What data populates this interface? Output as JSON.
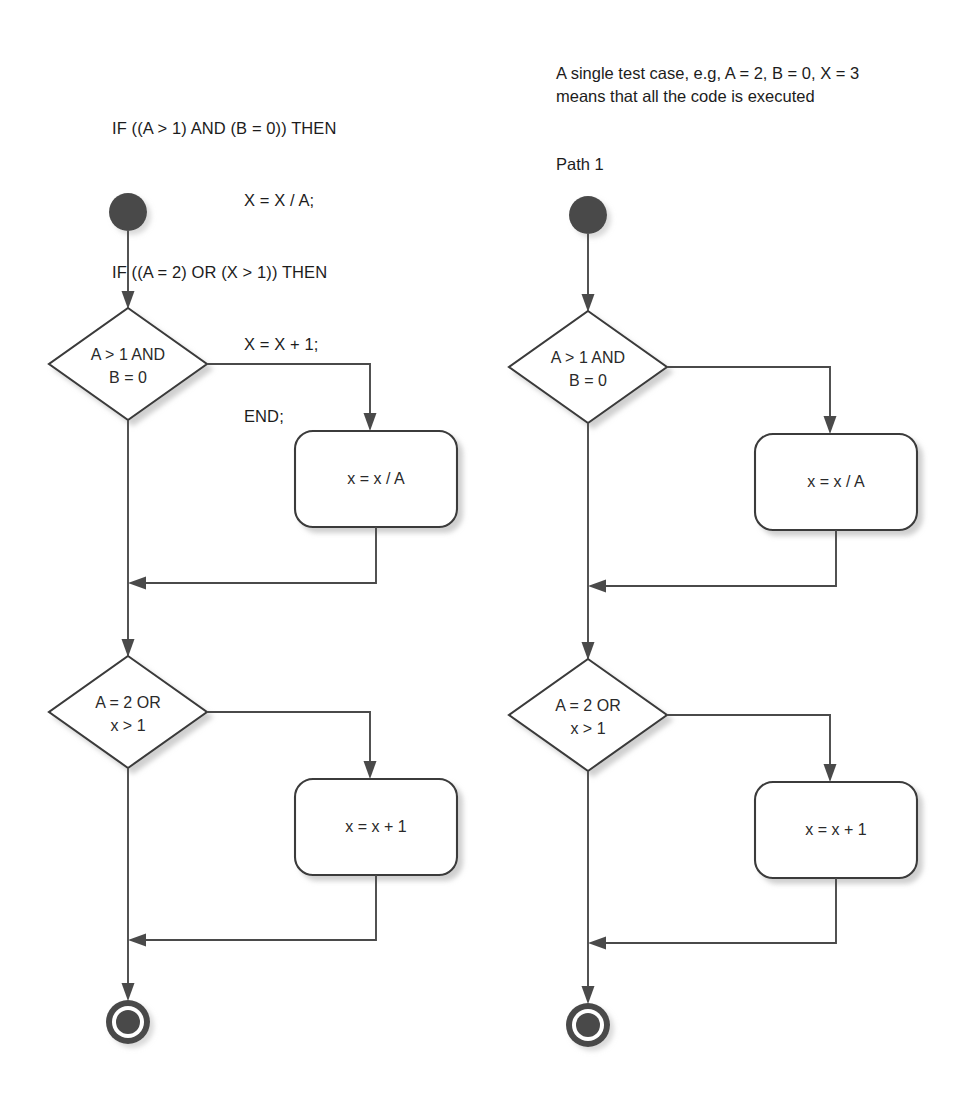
{
  "page": {
    "background": "#ffffff",
    "width": 971,
    "height": 1107
  },
  "colors": {
    "stroke": "#3a3a3a",
    "connector": "#4a4a4a",
    "node_fill": "#ffffff",
    "text": "#1c1c1c",
    "shadow": "#9a9a9a"
  },
  "code_snippet": {
    "lines": [
      {
        "text": "IF ((A > 1) AND (B = 0)) THEN",
        "indent": false
      },
      {
        "text": "X = X / A;",
        "indent": true
      },
      {
        "text": "IF ((A = 2) OR (X > 1)) THEN",
        "indent": false
      },
      {
        "text": "X = X + 1;",
        "indent": true
      },
      {
        "text": "END;",
        "indent": true
      }
    ]
  },
  "note": {
    "lines": [
      "A single test case, e.g, A = 2, B = 0, X = 3",
      "means that all the code is executed"
    ]
  },
  "path_label": "Path 1",
  "flowcharts": [
    {
      "id": "left-flowchart",
      "name": "flowchart-left",
      "offset_x": 0,
      "nodes": {
        "start": {
          "type": "start",
          "label": ""
        },
        "decision_1": {
          "type": "decision",
          "line1": "A > 1 AND",
          "line2": "B = 0"
        },
        "process_1": {
          "type": "process",
          "label": "x = x / A"
        },
        "decision_2": {
          "type": "decision",
          "line1": "A = 2 OR",
          "line2": "x > 1"
        },
        "process_2": {
          "type": "process",
          "label": "x = x + 1"
        },
        "end": {
          "type": "end",
          "label": ""
        }
      }
    },
    {
      "id": "right-flowchart",
      "name": "flowchart-right",
      "offset_x": 460,
      "nodes": {
        "start": {
          "type": "start",
          "label": ""
        },
        "decision_1": {
          "type": "decision",
          "line1": "A > 1 AND",
          "line2": "B = 0"
        },
        "process_1": {
          "type": "process",
          "label": "x = x / A"
        },
        "decision_2": {
          "type": "decision",
          "line1": "A = 2 OR",
          "line2": "x > 1"
        },
        "process_2": {
          "type": "process",
          "label": "x = x + 1"
        },
        "end": {
          "type": "end",
          "label": ""
        }
      }
    }
  ],
  "geometry": {
    "trunk_x": 128,
    "start_cy": 212,
    "start_r": 19,
    "decision1_cy": 364,
    "decision2_cy": 712,
    "diamond_w": 80,
    "diamond_h": 57,
    "box1": {
      "x": 295,
      "y": 431,
      "w": 162,
      "h": 96,
      "r": 18
    },
    "box2": {
      "x": 295,
      "y": 779,
      "w": 162,
      "h": 96,
      "r": 18
    },
    "branch_x": 370,
    "merge1_y": 583,
    "merge2_y": 940,
    "end_cy": 1022,
    "end_r": 22
  }
}
